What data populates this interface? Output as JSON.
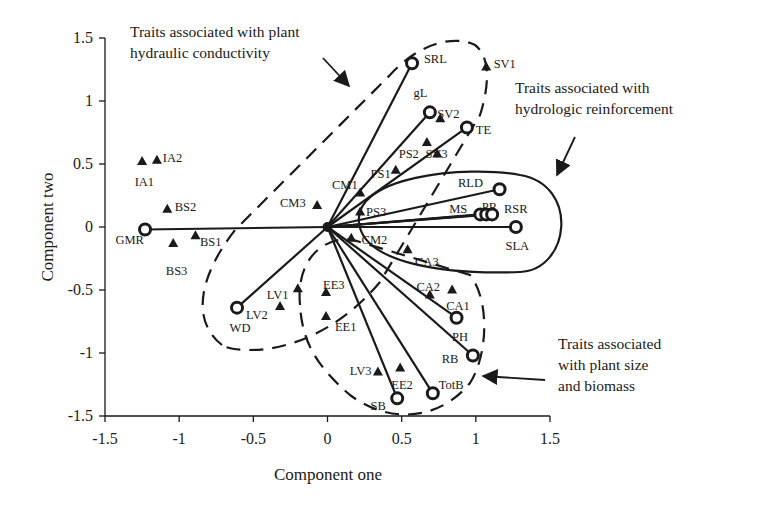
{
  "chart_data": {
    "type": "scatter",
    "title": "",
    "xlabel": "Component one",
    "ylabel": "Component two",
    "xlim": [
      -1.5,
      1.5
    ],
    "ylim": [
      -1.5,
      1.5
    ],
    "xticks": [
      -1.5,
      -1,
      -0.5,
      0,
      0.5,
      1,
      1.5
    ],
    "yticks": [
      -1.5,
      -1,
      -0.5,
      0,
      0.5,
      1,
      1.5
    ],
    "xtick_labels": [
      "-1.5",
      "-1",
      "-0.5",
      "0",
      "0.5",
      "1",
      "1.5"
    ],
    "ytick_labels": [
      "-1.5",
      "-1",
      "-0.5",
      "0",
      "0.5",
      "1",
      "1.5"
    ],
    "grid": false,
    "legend": null,
    "series": [
      {
        "name": "Trait loadings (vectors from origin)",
        "marker": "circle",
        "points": [
          {
            "label": "GMR",
            "x": -1.23,
            "y": -0.02,
            "lx": -1.43,
            "ly": -0.1
          },
          {
            "label": "SRL",
            "x": 0.57,
            "y": 1.3,
            "lx": 0.65,
            "ly": 1.33
          },
          {
            "label": "gL",
            "x": 0.69,
            "y": 0.91,
            "lx": 0.58,
            "ly": 1.06
          },
          {
            "label": "TE",
            "x": 0.94,
            "y": 0.79,
            "lx": 1.0,
            "ly": 0.77
          },
          {
            "label": "RLD",
            "x": 1.16,
            "y": 0.3,
            "lx": 0.88,
            "ly": 0.35
          },
          {
            "label": "MS",
            "x": 1.03,
            "y": 0.1,
            "lx": 0.82,
            "ly": 0.14
          },
          {
            "label": "PR",
            "x": 1.07,
            "y": 0.1,
            "lx": 1.04,
            "ly": 0.16
          },
          {
            "label": "RSR",
            "x": 1.11,
            "y": 0.1,
            "lx": 1.19,
            "ly": 0.14
          },
          {
            "label": "SLA",
            "x": 1.27,
            "y": 0.0,
            "lx": 1.2,
            "ly": -0.15
          },
          {
            "label": "PH",
            "x": 0.87,
            "y": -0.72,
            "lx": 0.84,
            "ly": -0.87
          },
          {
            "label": "RB",
            "x": 0.98,
            "y": -1.02,
            "lx": 0.77,
            "ly": -1.05
          },
          {
            "label": "TotB",
            "x": 0.71,
            "y": -1.32,
            "lx": 0.75,
            "ly": -1.25
          },
          {
            "label": "SB",
            "x": 0.47,
            "y": -1.36,
            "lx": 0.29,
            "ly": -1.42
          },
          {
            "label": "WD",
            "x": -0.61,
            "y": -0.64,
            "lx": -0.66,
            "ly": -0.8
          }
        ]
      },
      {
        "name": "Species / sites",
        "marker": "triangle",
        "points": [
          {
            "label": "IA1",
            "x": -1.25,
            "y": 0.52,
            "lx": -1.3,
            "ly": 0.36
          },
          {
            "label": "IA2",
            "x": -1.15,
            "y": 0.53,
            "lx": -1.11,
            "ly": 0.55
          },
          {
            "label": "BS2",
            "x": -1.08,
            "y": 0.14,
            "lx": -1.03,
            "ly": 0.16
          },
          {
            "label": "BS1",
            "x": -0.89,
            "y": -0.07,
            "lx": -0.86,
            "ly": -0.12
          },
          {
            "label": "BS3",
            "x": -1.04,
            "y": -0.13,
            "lx": -1.09,
            "ly": -0.35
          },
          {
            "label": "CM3",
            "x": -0.07,
            "y": 0.17,
            "lx": -0.32,
            "ly": 0.19
          },
          {
            "label": "CM1",
            "x": 0.22,
            "y": 0.27,
            "lx": 0.03,
            "ly": 0.33
          },
          {
            "label": "PS3",
            "x": 0.22,
            "y": 0.12,
            "lx": 0.26,
            "ly": 0.12
          },
          {
            "label": "PS1",
            "x": 0.46,
            "y": 0.45,
            "lx": 0.29,
            "ly": 0.42
          },
          {
            "label": "PS2",
            "x": 0.67,
            "y": 0.67,
            "lx": 0.48,
            "ly": 0.58
          },
          {
            "label": "SV3",
            "x": 0.74,
            "y": 0.58,
            "lx": 0.66,
            "ly": 0.58
          },
          {
            "label": "SV2",
            "x": 0.76,
            "y": 0.86,
            "lx": 0.74,
            "ly": 0.9
          },
          {
            "label": "SV1",
            "x": 1.07,
            "y": 1.27,
            "lx": 1.12,
            "ly": 1.29
          },
          {
            "label": "CM2",
            "x": 0.16,
            "y": -0.09,
            "lx": 0.23,
            "ly": -0.1
          },
          {
            "label": "CA3",
            "x": 0.54,
            "y": -0.18,
            "lx": 0.59,
            "ly": -0.28
          },
          {
            "label": "CA2",
            "x": 0.69,
            "y": -0.54,
            "lx": 0.6,
            "ly": -0.48
          },
          {
            "label": "CA1",
            "x": 0.84,
            "y": -0.5,
            "lx": 0.8,
            "ly": -0.63
          },
          {
            "label": "LV1",
            "x": -0.2,
            "y": -0.49,
            "lx": -0.41,
            "ly": -0.54
          },
          {
            "label": "LV2",
            "x": -0.32,
            "y": -0.63,
            "lx": -0.55,
            "ly": -0.7
          },
          {
            "label": "EE3",
            "x": -0.01,
            "y": -0.52,
            "lx": -0.03,
            "ly": -0.46
          },
          {
            "label": "EE1",
            "x": -0.01,
            "y": -0.71,
            "lx": 0.05,
            "ly": -0.79
          },
          {
            "label": "LV3",
            "x": 0.34,
            "y": -1.15,
            "lx": 0.15,
            "ly": -1.14
          },
          {
            "label": "EE2",
            "x": 0.49,
            "y": -1.12,
            "lx": 0.43,
            "ly": -1.25
          }
        ]
      }
    ],
    "annotations": [
      {
        "id": "hydraulic-conductivity",
        "lines": [
          "Traits associated with plant",
          "hydraulic conductivity"
        ],
        "text_px": [
          130,
          37
        ],
        "arrow_px": [
          [
            323,
            58
          ],
          [
            349,
            86
          ]
        ],
        "enclosure": "dashed"
      },
      {
        "id": "hydrologic-reinforcement",
        "lines": [
          "Traits associated with",
          "hydrologic reinforcement"
        ],
        "text_px": [
          515,
          93
        ],
        "arrow_px": [
          [
            575,
            137
          ],
          [
            557,
            175
          ]
        ],
        "enclosure": "solid"
      },
      {
        "id": "plant-size-biomass",
        "lines": [
          "Traits associated",
          "with plant size",
          "and biomass"
        ],
        "text_px": [
          558,
          349
        ],
        "arrow_px": [
          [
            545,
            380
          ],
          [
            483,
            376
          ]
        ],
        "enclosure": "dashed"
      }
    ]
  }
}
